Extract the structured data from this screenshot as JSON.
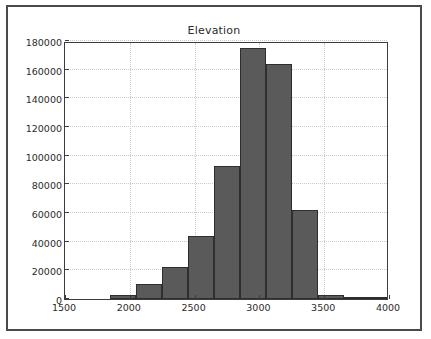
{
  "figure": {
    "title": "Elevation",
    "background_color": "#ffffff",
    "frame_color": "#4a4a4a",
    "bar_fill_color": "#5a5a5a",
    "bar_edge_color": "#2e2e2e",
    "grid_color": "#c9c9c9"
  },
  "chart_data": {
    "type": "bar",
    "title": "Elevation",
    "xlabel": "",
    "ylabel": "",
    "xlim": [
      1500,
      4000
    ],
    "ylim": [
      0,
      180000
    ],
    "grid": true,
    "legend": null,
    "bin_width": 200,
    "bin_edges": [
      1850,
      2050,
      2250,
      2450,
      2650,
      2850,
      3050,
      3250,
      3450,
      3650,
      3850,
      4000
    ],
    "categories": [
      "1850-2050",
      "2050-2250",
      "2250-2450",
      "2450-2650",
      "2650-2850",
      "2850-3050",
      "3050-3250",
      "3250-3450",
      "3450-3650",
      "3650-3850",
      "3850-4000"
    ],
    "values": [
      3000,
      10500,
      22000,
      44000,
      93000,
      175000,
      164000,
      62000,
      3000,
      600,
      300
    ],
    "xticks": [
      1500,
      2000,
      2500,
      3000,
      3500,
      4000
    ],
    "xtick_labels": [
      "1500",
      "2000",
      "2500",
      "3000",
      "3500",
      "4000"
    ],
    "yticks": [
      0,
      20000,
      40000,
      60000,
      80000,
      100000,
      120000,
      140000,
      160000,
      180000
    ],
    "ytick_labels": [
      "0",
      "20000",
      "40000",
      "60000",
      "80000",
      "100000",
      "120000",
      "140000",
      "160000",
      "180000"
    ]
  }
}
